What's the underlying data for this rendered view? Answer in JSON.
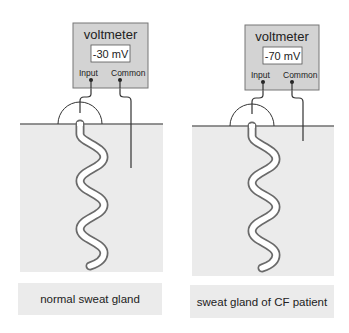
{
  "panels": [
    {
      "id": "normal",
      "voltmeter": {
        "title": "voltmeter",
        "reading": "-30 mV",
        "input_label": "Input",
        "common_label": "Common"
      },
      "caption": "normal sweat gland"
    },
    {
      "id": "cf",
      "voltmeter": {
        "title": "voltmeter",
        "reading": "-70 mV",
        "input_label": "Input",
        "common_label": "Common"
      },
      "caption": "sweat gland of CF patient"
    }
  ],
  "colors": {
    "voltmeter_fill": "#d3d3d3",
    "voltmeter_stroke": "#777777",
    "tissue_fill": "#ebebeb",
    "surface_line": "#6f6f6f",
    "wire": "#333333",
    "gland_outline": "#6a6a6a",
    "gland_lumen": "#ffffff"
  }
}
